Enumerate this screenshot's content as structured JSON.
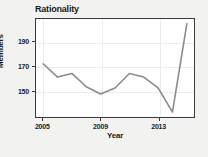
{
  "chart_data": {
    "type": "line",
    "title": "Rationality",
    "xlabel": "Year",
    "ylabel": "Members",
    "x": [
      2005,
      2006,
      2007,
      2008,
      2009,
      2010,
      2011,
      2012,
      2013,
      2014,
      2015
    ],
    "values": [
      172,
      161,
      164,
      153,
      147,
      152,
      164,
      161,
      152,
      132,
      205
    ],
    "series": [
      {
        "name": "Members",
        "values": [
          172,
          161,
          164,
          153,
          147,
          152,
          164,
          161,
          152,
          132,
          205
        ]
      }
    ],
    "xtick_labels": [
      "2005",
      "2009",
      "2013"
    ],
    "xticks": [
      2005,
      2009,
      2013
    ],
    "ytick_labels": [
      "150",
      "170",
      "190"
    ],
    "yticks": [
      150,
      170,
      190
    ],
    "xlim": [
      2004.5,
      2015.5
    ],
    "ylim": [
      128,
      209
    ],
    "grid": true,
    "legend": "none",
    "line_color": "#8c8c8c",
    "plot_background": "#ffffff",
    "figure_background": "#f2f2f0",
    "axis_color": "#3b3b3b",
    "grid_color": "#ececec"
  }
}
